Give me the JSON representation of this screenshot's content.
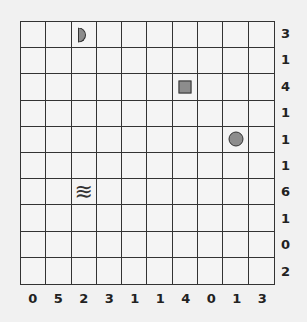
{
  "puzzle": {
    "rows": 10,
    "cols": 10,
    "row_clues": [
      "3",
      "1",
      "4",
      "1",
      "1",
      "1",
      "6",
      "1",
      "0",
      "2"
    ],
    "col_clues": [
      "0",
      "5",
      "2",
      "3",
      "1",
      "1",
      "4",
      "0",
      "1",
      "3"
    ],
    "objects": [
      {
        "type": "half-circle",
        "row": 0,
        "col": 2,
        "name": "half-circle-marker"
      },
      {
        "type": "square",
        "row": 2,
        "col": 6,
        "name": "square-marker"
      },
      {
        "type": "circle",
        "row": 4,
        "col": 8,
        "name": "circle-marker"
      },
      {
        "type": "wave",
        "row": 6,
        "col": 2,
        "name": "wave-marker",
        "glyph": "≋"
      }
    ]
  },
  "colors": {
    "marker_fill": "#8c8c8c",
    "line": "#333333",
    "background": "#f1f1f1"
  }
}
